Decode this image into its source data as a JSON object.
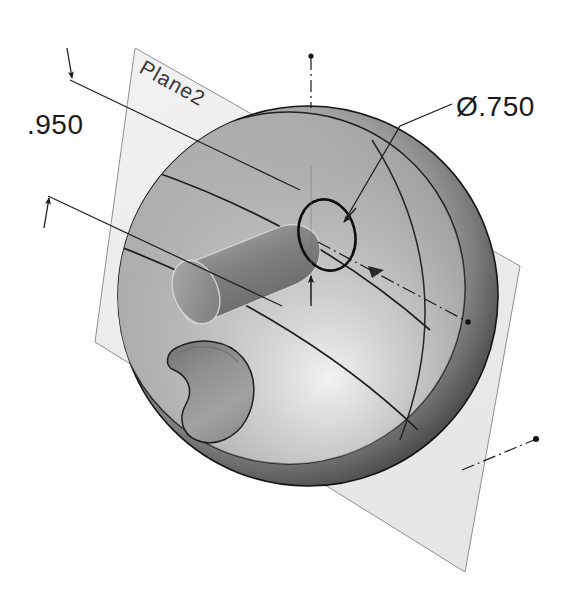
{
  "app": {
    "kind": "cad-3d-model-view",
    "background_color": "#fefefe"
  },
  "model": {
    "shape": "sphere",
    "features": [
      "cylindrical-boss",
      "kidney-pocket",
      "through-hole",
      "section-plane"
    ],
    "sphere": {
      "center_x": 308,
      "center_y": 296,
      "radius": 190,
      "fill_light": "#b9b9b9",
      "fill_dark": "#2e2e2e",
      "edge_color": "#1d1d1d"
    },
    "reference_plane": {
      "label": "Plane2",
      "fill": "#eeeeee",
      "edge_color": "#8a8a8a",
      "corners": "135,48 520,266 465,572 95,342"
    },
    "cylinder": {
      "fill_top": "#8c8c8c",
      "fill_cap": "#9a9a9a"
    },
    "pocket": {
      "fill": "#8f8f8f"
    },
    "hole_circle": {
      "cx": 327,
      "cy": 235,
      "rx": 28,
      "ry": 36,
      "stroke": "#101010"
    }
  },
  "annotations": {
    "dimension_linear": {
      "value": ".950",
      "type": "linear-dimension",
      "text_x": 27,
      "text_y": 133,
      "arrow_top": "68,62",
      "arrow_bottom": "48,192"
    },
    "dimension_diameter": {
      "value": "Ø.750",
      "type": "diameter-dimension",
      "text_x": 456,
      "text_y": 115,
      "leader_from": "344,222",
      "leader_elbow": "400,126",
      "leader_to": "452,104"
    },
    "plane_label": {
      "value": "Plane2",
      "x": 138,
      "y": 70,
      "rotation_deg": 29
    },
    "centerline_vertical": {
      "x": 311,
      "y_top": 55,
      "y_bottom": 110
    },
    "centerline_axis": {
      "from": "318,242",
      "to": "468,322"
    }
  },
  "colors": {
    "ink": "#1b1b1b",
    "dim_line": "#2a2a2a",
    "plane_edge": "#8a8a8a",
    "plane_fill": "#ededed",
    "sphere_light": "#b8b8b8",
    "sphere_shadow": "#2b2b2b"
  }
}
